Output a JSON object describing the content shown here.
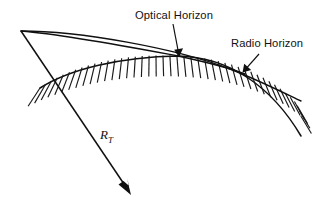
{
  "figure": {
    "width": 321,
    "height": 215,
    "background_color": "#ffffff",
    "ink_color": "#101010"
  },
  "labels": {
    "optical_horizon": "Optical Horizon",
    "radio_horizon": "Radio Horizon",
    "earth_radius_symbol": "R",
    "earth_radius_subscript": "T"
  },
  "annotations": [
    {
      "name": "optical-horizon-leader",
      "label": "Optical Horizon",
      "from": [
        173,
        24
      ],
      "to": [
        178,
        56
      ],
      "arrowhead": "at-end"
    },
    {
      "name": "radio-horizon-leader",
      "label": "Radio Horizon",
      "from": [
        259,
        54
      ],
      "to": [
        243,
        72
      ],
      "arrowhead": "at-end"
    },
    {
      "name": "earth-radius-arrow",
      "label": "R_T",
      "from": [
        21,
        31
      ],
      "to": [
        130,
        193
      ],
      "arrowhead": "at-end"
    }
  ],
  "geometry": {
    "observer_apex": [
      21,
      31
    ],
    "optical_horizon_tangent_point": [
      178,
      56
    ],
    "earth_surface_arc": {
      "start": [
        40,
        88
      ],
      "peak": [
        178,
        56
      ],
      "end": [
        301,
        136
      ],
      "description": "curved Earth surface, hatched on the interior side"
    },
    "radio_horizon_ray": {
      "start": [
        21,
        31
      ],
      "end": [
        301,
        101
      ],
      "description": "upper refracted ray reaching farther than the optical ray"
    },
    "optical_horizon_ray": {
      "start": [
        21,
        31
      ],
      "end": [
        245,
        74
      ],
      "description": "straight line-of-sight ray tangent to the Earth surface"
    },
    "hatch": {
      "count": 44,
      "description": "short strokes normal to the Earth arc, on the Earth side"
    }
  }
}
